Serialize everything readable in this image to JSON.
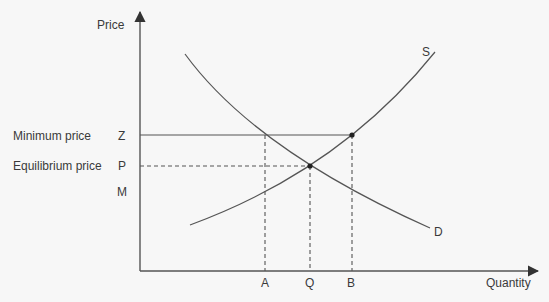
{
  "diagram": {
    "axes": {
      "y_label": "Price",
      "x_label": "Quantity"
    },
    "price_labels": {
      "minimum_price": "Minimum price",
      "equilibrium_price": "Equilibrium price"
    },
    "price_levels": [
      "Z",
      "P",
      "M"
    ],
    "quantity_levels": [
      "A",
      "Q",
      "B"
    ],
    "curves": {
      "supply": "S",
      "demand": "D"
    },
    "colors": {
      "line": "#555555",
      "text": "#3a3a3a",
      "background": "#f7f7f7"
    }
  }
}
